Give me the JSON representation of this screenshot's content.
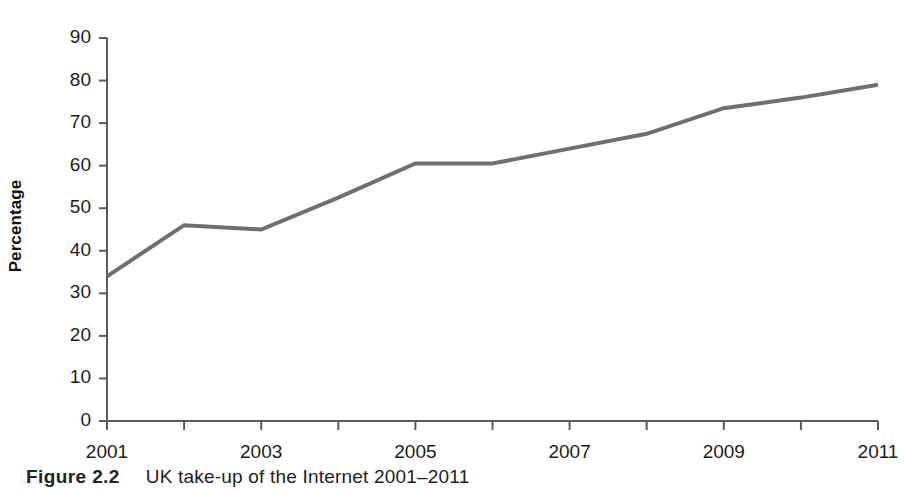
{
  "figure": {
    "caption_label": "Figure 2.2",
    "caption_text": "UK take-up of the Internet 2001–2011"
  },
  "chart_data": {
    "type": "line",
    "title": "",
    "xlabel": "",
    "ylabel": "Percentage",
    "x": [
      2001,
      2002,
      2003,
      2004,
      2005,
      2006,
      2007,
      2008,
      2009,
      2010,
      2011
    ],
    "values": [
      34,
      46,
      45,
      52.5,
      60.5,
      60.5,
      64,
      67.5,
      73.5,
      76,
      79
    ],
    "series": [
      {
        "name": "UK take-up of the Internet",
        "values": [
          34,
          46,
          45,
          52.5,
          60.5,
          60.5,
          64,
          67.5,
          73.5,
          76,
          79
        ]
      }
    ],
    "xlim": [
      2001,
      2011
    ],
    "ylim": [
      0,
      90
    ],
    "ytick_labels": [
      "0",
      "10",
      "20",
      "30",
      "40",
      "50",
      "60",
      "70",
      "80",
      "90"
    ],
    "yticks": [
      0,
      10,
      20,
      30,
      40,
      50,
      60,
      70,
      80,
      90
    ],
    "xtick_labels": [
      "2001",
      "2003",
      "2005",
      "2007",
      "2009",
      "2011"
    ],
    "xticks": [
      2001,
      2003,
      2005,
      2007,
      2009,
      2011
    ],
    "xtick_minor": [
      2002,
      2004,
      2006,
      2008,
      2010
    ],
    "grid": false,
    "legend": "none",
    "line_color": "#6f6f6f",
    "axis_color": "#5a5a5a",
    "line_width": 4
  }
}
